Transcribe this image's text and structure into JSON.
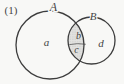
{
  "figure": {
    "index_label": "(1)",
    "set_a_label": "A",
    "set_b_label": "B",
    "region_a_label": "a",
    "region_b_label": "b",
    "region_c_label": "c",
    "region_d_label": "d",
    "colors": {
      "background": "#f8f8f6",
      "outline": "#3d3d3d",
      "text": "#454545",
      "shade_base": "#e2e2e0",
      "shade_dots": "#b3b3b1",
      "divider": "#5a5a5a"
    }
  }
}
